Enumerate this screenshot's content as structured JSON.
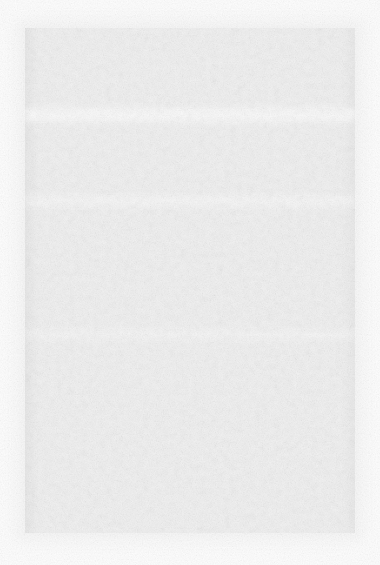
{
  "document": {
    "kind": "scanned-page",
    "condition": "blank",
    "visible_text": "",
    "notes": "No legible text, glyphs, headings, or interface controls are present in the image.",
    "page": {
      "width_px": 380,
      "height_px": 565
    },
    "background_color": "#fdfdfd",
    "content_block": {
      "fill_color": "#f2f2f2",
      "left_px": 25,
      "top_px": 28,
      "width_px": 330,
      "height_px": 505
    },
    "bands": [
      {
        "name": "upper-fold-band",
        "top_px": 108,
        "height_px": 14,
        "color": "#fafafa"
      },
      {
        "name": "mid-fold-band",
        "top_px": 196,
        "height_px": 10,
        "color": "#fafafa"
      },
      {
        "name": "lower-fold-band",
        "top_px": 330,
        "height_px": 9,
        "color": "#fafafa"
      }
    ],
    "texture": {
      "name": "paper-grain",
      "description": "uniform mottled paper fiber noise"
    }
  }
}
